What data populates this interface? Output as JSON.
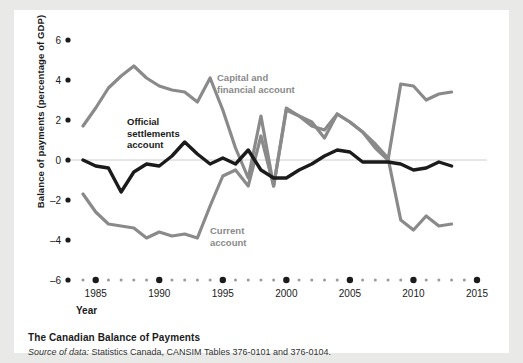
{
  "figure": {
    "caption_title": "The Canadian Balance of Payments",
    "source_prefix": "Source of data:",
    "source_text": " Statistics Canada, CANSIM Tables 376-0101 and 376-0104."
  },
  "colors": {
    "background": "#e9e9e7",
    "panel": "#ffffff",
    "gray_series": "#8a8a8a",
    "dark_series": "#1b1b1b",
    "zero_line": "#cccccc",
    "tick_dot": "#1b1b1b"
  },
  "chart_data": {
    "type": "line",
    "title": "The Canadian Balance of Payments",
    "xlabel": "Year",
    "ylabel": "Balance of payments (percentage of GDP)",
    "xlim": [
      1984,
      2015
    ],
    "ylim": [
      -6,
      6
    ],
    "grid": false,
    "zero_line": true,
    "legend": "inline-annotations",
    "y_ticks": [
      6,
      4,
      2,
      0,
      -2,
      -4,
      -6
    ],
    "y_tick_labels": [
      "6",
      "4",
      "2",
      "0",
      "–2",
      "–4",
      "–6"
    ],
    "x_ticks": [
      1985,
      1990,
      1995,
      2000,
      2005,
      2010,
      2015
    ],
    "x_tick_labels": [
      "1985",
      "1990",
      "1995",
      "2000",
      "2005",
      "2010",
      "2015"
    ],
    "x_minor_years": [
      1984,
      1986,
      1987,
      1988,
      1989,
      1991,
      1992,
      1993,
      1994,
      1996,
      1997,
      1998,
      1999,
      2001,
      2002,
      2003,
      2004,
      2006,
      2007,
      2008,
      2009,
      2011,
      2012,
      2013,
      2014
    ],
    "x": [
      1984,
      1985,
      1986,
      1987,
      1988,
      1989,
      1990,
      1991,
      1992,
      1993,
      1994,
      1995,
      1996,
      1997,
      1998,
      1999,
      2000,
      2001,
      2002,
      2003,
      2004,
      2005,
      2006,
      2007,
      2008,
      2009,
      2010,
      2011,
      2012,
      2013
    ],
    "series": [
      {
        "name": "Capital and financial account",
        "color": "#8a8a8a",
        "label_line1": "Capital and",
        "label_line2": "financial account",
        "values": [
          1.7,
          2.6,
          3.6,
          4.2,
          4.7,
          4.1,
          3.7,
          3.5,
          3.4,
          2.9,
          4.1,
          2.5,
          0.6,
          -0.9,
          2.2,
          -1.3,
          2.5,
          2.2,
          1.9,
          1.1,
          2.3,
          1.9,
          1.4,
          0.6,
          0.0,
          3.8,
          3.7,
          3.0,
          3.3,
          3.4
        ]
      },
      {
        "name": "Current account",
        "color": "#8a8a8a",
        "label_line1": "Current",
        "label_line2": "account",
        "values": [
          -1.7,
          -2.6,
          -3.2,
          -3.3,
          -3.4,
          -3.9,
          -3.6,
          -3.8,
          -3.7,
          -3.9,
          -2.3,
          -0.8,
          -0.5,
          -1.3,
          1.2,
          -1.3,
          2.6,
          2.2,
          1.7,
          1.5,
          2.3,
          1.9,
          1.4,
          0.8,
          0.1,
          -3.0,
          -3.5,
          -2.8,
          -3.3,
          -3.2
        ]
      },
      {
        "name": "Official settlements account",
        "color": "#1b1b1b",
        "label_line1": "Official",
        "label_line2": "settlements",
        "label_line3": "account",
        "values": [
          0.0,
          -0.3,
          -0.4,
          -1.6,
          -0.6,
          -0.2,
          -0.3,
          0.2,
          0.9,
          0.3,
          -0.2,
          0.1,
          -0.2,
          0.5,
          -0.5,
          -0.9,
          -0.9,
          -0.5,
          -0.2,
          0.2,
          0.5,
          0.4,
          -0.1,
          -0.1,
          -0.1,
          -0.2,
          -0.5,
          -0.4,
          -0.1,
          -0.3
        ]
      }
    ]
  }
}
